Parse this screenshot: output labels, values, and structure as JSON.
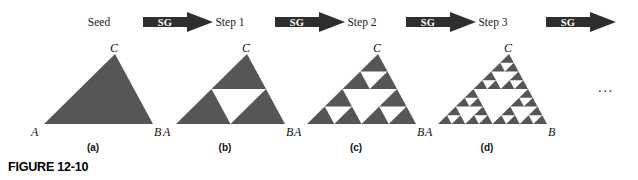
{
  "figure": {
    "number_label": "FIGURE 12-10",
    "ellipsis": "...",
    "fill_color": "#565656",
    "arrow_color": "#2e2e2e",
    "background_color": "#ffffff"
  },
  "stages": [
    {
      "id": "seed",
      "stage_label": "Seed",
      "sub_caption": "(a)",
      "depth": 0,
      "vertices": {
        "left": "A",
        "right": "B",
        "apex": "C"
      }
    },
    {
      "id": "step-1",
      "stage_label": "Step 1",
      "sub_caption": "(b)",
      "depth": 1,
      "vertices": {
        "left": "A",
        "right": "B",
        "apex": "C"
      }
    },
    {
      "id": "step-2",
      "stage_label": "Step 2",
      "sub_caption": "(c)",
      "depth": 2,
      "vertices": {
        "left": "A",
        "right": "B",
        "apex": "C"
      }
    },
    {
      "id": "step-3",
      "stage_label": "Step 3",
      "sub_caption": "(d)",
      "depth": 3,
      "vertices": {
        "left": "A",
        "right": "B",
        "apex": "C"
      }
    }
  ],
  "arrows": [
    {
      "id": "arrow-1",
      "label": "SG"
    },
    {
      "id": "arrow-2",
      "label": "SG"
    },
    {
      "id": "arrow-3",
      "label": "SG"
    },
    {
      "id": "arrow-4",
      "label": "SG"
    }
  ]
}
